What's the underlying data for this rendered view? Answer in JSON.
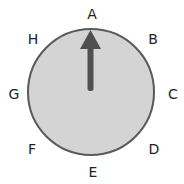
{
  "dial": {
    "fill": "#d4d4d4",
    "stroke": "#5a5a5a",
    "arrow_color": "#505050",
    "arrow_direction": "A",
    "labels": {
      "A": "A",
      "B": "B",
      "C": "C",
      "D": "D",
      "E": "E",
      "F": "F",
      "G": "G",
      "H": "H"
    }
  }
}
